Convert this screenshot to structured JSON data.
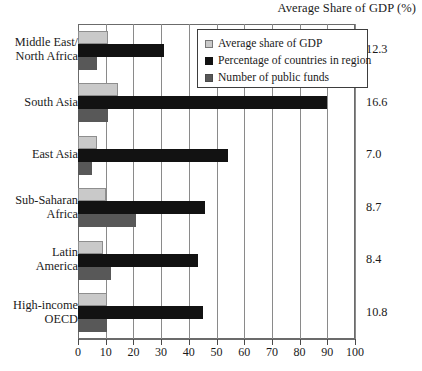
{
  "chart_data": {
    "type": "bar",
    "orientation": "horizontal",
    "title": "Average Share of GDP (%)",
    "xlabel": "",
    "ylabel": "",
    "xlim": [
      0,
      100
    ],
    "xticks": [
      0,
      10,
      20,
      30,
      40,
      50,
      60,
      70,
      80,
      90,
      100
    ],
    "grid": true,
    "legend_position": "top-right",
    "categories": [
      "Middle East/\nNorth Africa",
      "South Asia",
      "East Asia",
      "Sub-Saharan\nAfrica",
      "Latin\nAmerica",
      "High-income\nOECD"
    ],
    "series": [
      {
        "name": "Average share of GDP",
        "color": "#c9c9c9",
        "values": [
          11.0,
          14.5,
          7.0,
          10.0,
          9.0,
          10.5
        ]
      },
      {
        "name": "Percentage of countries in region",
        "color": "#121212",
        "values": [
          31.0,
          90.0,
          54.0,
          46.0,
          43.5,
          45.0
        ]
      },
      {
        "name": "Number of public funds",
        "color": "#585858",
        "values": [
          7.0,
          11.0,
          5.0,
          21.0,
          12.0,
          10.5
        ]
      }
    ],
    "row_values": {
      "label": "Average Share of GDP (%)",
      "values": [
        "12.3",
        "16.6",
        "7.0",
        "8.7",
        "8.4",
        "10.8"
      ]
    }
  }
}
